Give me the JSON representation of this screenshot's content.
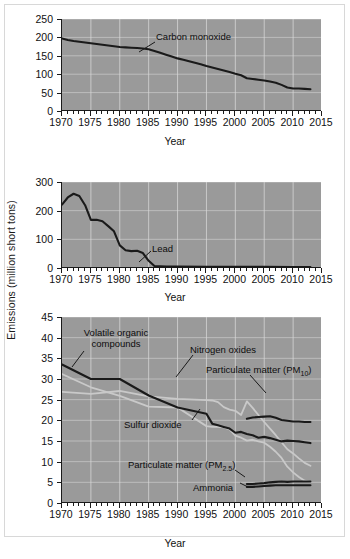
{
  "figure": {
    "y_axis_label": "Emissions (million short tons)",
    "x_axis_title": "Year",
    "background_color": "#9a9a9a",
    "line_color_dark": "#1a1a1a",
    "line_color_light": "#c9c9c9",
    "grid_color": "#d9d9d9"
  },
  "panels": [
    {
      "name": "carbon-monoxide-panel",
      "x_axis_title": "Year",
      "yticks": [
        "0",
        "50",
        "100",
        "150",
        "200",
        "250"
      ],
      "xticks": [
        "1970",
        "1975",
        "1980",
        "1985",
        "1990",
        "1995",
        "2000",
        "2005",
        "2010",
        "2015"
      ],
      "annotations": [
        {
          "name": "carbon-monoxide-label",
          "text": "Carbon monoxide"
        }
      ]
    },
    {
      "name": "lead-panel",
      "x_axis_title": "Year",
      "yticks": [
        "0",
        "100",
        "200",
        "300"
      ],
      "xticks": [
        "1970",
        "1975",
        "1980",
        "1985",
        "1990",
        "1995",
        "2000",
        "2005",
        "2010",
        "2015"
      ],
      "annotations": [
        {
          "name": "lead-label",
          "text": "Lead"
        }
      ]
    },
    {
      "name": "multi-pollutant-panel",
      "x_axis_title": "Year",
      "yticks": [
        "0",
        "5",
        "10",
        "15",
        "20",
        "25",
        "30",
        "35",
        "40",
        "45"
      ],
      "xticks": [
        "1970",
        "1975",
        "1980",
        "1985",
        "1990",
        "1995",
        "2000",
        "2005",
        "2010",
        "2015"
      ],
      "annotations": [
        {
          "name": "voc-label-line1",
          "text": "Volatile organic"
        },
        {
          "name": "voc-label-line2",
          "text": "compounds"
        },
        {
          "name": "nitrogen-oxides-label",
          "text": "Nitrogen oxides"
        },
        {
          "name": "pm10-label",
          "text": "Particulate matter (PM"
        },
        {
          "name": "pm10-label-sub",
          "text": "10"
        },
        {
          "name": "pm10-label-end",
          "text": ")"
        },
        {
          "name": "sulfur-dioxide-label",
          "text": "Sulfur dioxide"
        },
        {
          "name": "pm25-label",
          "text": "Particulate matter (PM"
        },
        {
          "name": "pm25-label-sub",
          "text": "2.5"
        },
        {
          "name": "pm25-label-end",
          "text": ")"
        },
        {
          "name": "ammonia-label",
          "text": "Ammonia"
        }
      ]
    }
  ],
  "chart_data": [
    {
      "type": "line",
      "title": "",
      "xlabel": "Year",
      "ylabel": "Emissions (million short tons)",
      "xlim": [
        1970,
        2015
      ],
      "ylim": [
        0,
        250
      ],
      "grid": true,
      "legend": "annotated-inline",
      "series": [
        {
          "name": "Carbon monoxide",
          "color": "#1a1a1a",
          "x": [
            1970,
            1971,
            1972,
            1973,
            1974,
            1975,
            1976,
            1977,
            1978,
            1979,
            1980,
            1981,
            1982,
            1983,
            1984,
            1985,
            1986,
            1987,
            1988,
            1989,
            1990,
            1991,
            1992,
            1993,
            1994,
            1995,
            1996,
            1997,
            1998,
            1999,
            2000,
            2001,
            2002,
            2003,
            2004,
            2005,
            2006,
            2007,
            2008,
            2009,
            2010,
            2011,
            2012,
            2013
          ],
          "y": [
            197,
            193,
            190,
            188,
            186,
            184,
            182,
            180,
            178,
            176,
            174,
            173,
            172,
            171,
            170,
            168,
            163,
            158,
            153,
            148,
            143,
            139,
            135,
            131,
            127,
            122,
            118,
            114,
            110,
            106,
            101,
            97,
            89,
            87,
            85,
            83,
            80,
            77,
            71,
            64,
            61,
            61,
            60,
            59
          ]
        }
      ]
    },
    {
      "type": "line",
      "title": "",
      "xlabel": "Year",
      "ylabel": "Emissions (million short tons)",
      "xlim": [
        1970,
        2015
      ],
      "ylim": [
        0,
        300
      ],
      "grid": true,
      "legend": "annotated-inline",
      "series": [
        {
          "name": "Lead",
          "color": "#1a1a1a",
          "x": [
            1970,
            1971,
            1972,
            1973,
            1974,
            1975,
            1976,
            1977,
            1978,
            1979,
            1980,
            1981,
            1982,
            1983,
            1984,
            1985,
            1986,
            1987,
            1988,
            1989,
            1990,
            1995,
            2000,
            2005,
            2010,
            2013
          ],
          "y": [
            221,
            246,
            259,
            251,
            219,
            168,
            168,
            163,
            146,
            128,
            79,
            62,
            59,
            60,
            52,
            25,
            7,
            6,
            5,
            5,
            5,
            4,
            4,
            4,
            3,
            3
          ]
        }
      ]
    },
    {
      "type": "line",
      "title": "",
      "xlabel": "Year",
      "ylabel": "Emissions (million short tons)",
      "xlim": [
        1970,
        2015
      ],
      "ylim": [
        0,
        45
      ],
      "grid": true,
      "legend": "annotated-inline",
      "series": [
        {
          "name": "Volatile organic compounds",
          "color": "#1a1a1a",
          "x": [
            1970,
            1975,
            1980,
            1985,
            1990,
            1995,
            1996,
            1997,
            1998,
            1999,
            2000,
            2001,
            2002,
            2003,
            2004,
            2005,
            2006,
            2007,
            2008,
            2009,
            2010,
            2011,
            2012,
            2013
          ],
          "y": [
            33.5,
            30.0,
            30.0,
            26.0,
            23.1,
            21.6,
            19.2,
            18.8,
            18.4,
            18.0,
            17.0,
            17.2,
            16.7,
            16.4,
            15.8,
            16.0,
            15.7,
            15.3,
            14.9,
            15.1,
            15.0,
            14.9,
            14.7,
            14.5
          ]
        },
        {
          "name": "Nitrogen oxides",
          "color": "#c9c9c9",
          "x": [
            1970,
            1975,
            1980,
            1985,
            1990,
            1995,
            1996,
            1997,
            1998,
            1999,
            2000,
            2001,
            2002,
            2003,
            2004,
            2005,
            2006,
            2007,
            2008,
            2009,
            2010,
            2011,
            2012,
            2013
          ],
          "y": [
            26.9,
            26.4,
            27.1,
            25.8,
            25.2,
            24.9,
            24.8,
            24.4,
            23.2,
            22.6,
            22.3,
            21.3,
            24.6,
            23.0,
            21.3,
            19.6,
            18.0,
            16.4,
            14.7,
            13.0,
            12.0,
            10.8,
            9.7,
            9.0
          ]
        },
        {
          "name": "Sulfur dioxide",
          "color": "#c9c9c9",
          "x": [
            1970,
            1975,
            1980,
            1985,
            1990,
            1995,
            1996,
            1997,
            1998,
            1999,
            2000,
            2001,
            2002,
            2003,
            2004,
            2005,
            2006,
            2007,
            2008,
            2009,
            2010,
            2011,
            2012,
            2013
          ],
          "y": [
            31.2,
            28.0,
            25.9,
            23.3,
            23.1,
            18.6,
            18.4,
            18.4,
            18.3,
            17.8,
            16.3,
            15.8,
            15.1,
            15.3,
            14.9,
            14.6,
            13.6,
            12.4,
            10.9,
            8.8,
            7.4,
            6.3,
            5.4,
            5.1
          ]
        },
        {
          "name": "Particulate matter (PM10)",
          "color": "#1a1a1a",
          "x": [
            2002,
            2003,
            2004,
            2005,
            2006,
            2007,
            2008,
            2009,
            2010,
            2011,
            2012,
            2013
          ],
          "y": [
            20.4,
            20.7,
            20.8,
            20.9,
            21.0,
            20.6,
            20.1,
            19.9,
            19.7,
            19.7,
            19.6,
            19.6
          ]
        },
        {
          "name": "Particulate matter (PM2.5)",
          "color": "#1a1a1a",
          "x": [
            2002,
            2003,
            2004,
            2005,
            2006,
            2007,
            2008,
            2009,
            2010,
            2011,
            2012,
            2013
          ],
          "y": [
            4.6,
            4.6,
            4.7,
            4.8,
            5.0,
            5.1,
            5.2,
            5.1,
            5.2,
            5.2,
            5.2,
            5.2
          ]
        },
        {
          "name": "Ammonia",
          "color": "#1a1a1a",
          "x": [
            2002,
            2003,
            2004,
            2005,
            2006,
            2007,
            2008,
            2009,
            2010,
            2011,
            2012,
            2013
          ],
          "y": [
            3.9,
            3.9,
            4.0,
            4.1,
            4.2,
            4.3,
            4.3,
            4.3,
            4.3,
            4.3,
            4.3,
            4.3
          ]
        }
      ]
    }
  ]
}
